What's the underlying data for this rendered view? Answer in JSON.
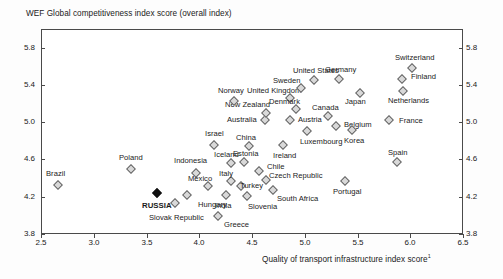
{
  "chart_data": {
    "type": "scatter",
    "title": "",
    "ylabel": "WEF Global competitiveness index score (overall index)",
    "xlabel": "Quality of transport infrastructure index score",
    "xlabel_footnote": "1",
    "xlim": [
      2.5,
      6.5
    ],
    "ylim": [
      3.8,
      6.0
    ],
    "xticks": [
      "2.5",
      "3.0",
      "3.5",
      "4.0",
      "4.5",
      "5.0",
      "5.5",
      "6.0",
      "6.5"
    ],
    "xtick_values": [
      2.5,
      3.0,
      3.5,
      4.0,
      4.5,
      5.0,
      5.5,
      6.0,
      6.5
    ],
    "yticks": [
      "5.8",
      "5.4",
      "5.0",
      "4.6",
      "4.2",
      "3.8"
    ],
    "ytick_values": [
      5.8,
      5.4,
      5.0,
      4.6,
      4.2,
      3.8
    ],
    "grid": false,
    "legend": "none",
    "marker_shape": "diamond",
    "marker_fill": "#d9d9d9",
    "marker_edge": "#666666",
    "highlight_fill": "#111111",
    "points": [
      {
        "name": "Brazil",
        "x": 2.66,
        "y": 4.33,
        "lx": -2,
        "ly": -11,
        "anchor": "middle",
        "bold": false
      },
      {
        "name": "Poland",
        "x": 3.35,
        "y": 4.5,
        "lx": 0,
        "ly": -11,
        "anchor": "middle",
        "bold": false
      },
      {
        "name": "RUSSIA",
        "x": 3.6,
        "y": 4.24,
        "lx": 0,
        "ly": 13,
        "anchor": "middle",
        "bold": true
      },
      {
        "name": "Slovak Republic",
        "x": 3.77,
        "y": 4.13,
        "lx": 2,
        "ly": 15,
        "anchor": "middle",
        "bold": false
      },
      {
        "name": "Hungary",
        "x": 3.88,
        "y": 4.22,
        "lx": 26,
        "ly": 10,
        "anchor": "middle",
        "bold": false
      },
      {
        "name": "Indonesia",
        "x": 3.97,
        "y": 4.45,
        "lx": -6,
        "ly": -12,
        "anchor": "middle",
        "bold": false
      },
      {
        "name": "Mexico",
        "x": 4.08,
        "y": 4.32,
        "lx": -8,
        "ly": -7,
        "anchor": "middle",
        "bold": false
      },
      {
        "name": "Greece",
        "x": 4.18,
        "y": 3.99,
        "lx": 18,
        "ly": 9,
        "anchor": "middle",
        "bold": false
      },
      {
        "name": "India",
        "x": 4.25,
        "y": 4.22,
        "lx": -2,
        "ly": 11,
        "anchor": "middle",
        "bold": false
      },
      {
        "name": "Italy",
        "x": 4.3,
        "y": 4.37,
        "lx": -5,
        "ly": -7,
        "anchor": "middle",
        "bold": false
      },
      {
        "name": "Iceland",
        "x": 4.3,
        "y": 4.56,
        "lx": -4,
        "ly": -8,
        "anchor": "middle",
        "bold": false
      },
      {
        "name": "Turkey",
        "x": 4.4,
        "y": 4.32,
        "lx": 10,
        "ly": 0,
        "anchor": "middle",
        "bold": false
      },
      {
        "name": "Estonia",
        "x": 4.42,
        "y": 4.57,
        "lx": 2,
        "ly": -8,
        "anchor": "middle",
        "bold": false
      },
      {
        "name": "Slovenia",
        "x": 4.45,
        "y": 4.21,
        "lx": 16,
        "ly": 11,
        "anchor": "middle",
        "bold": false
      },
      {
        "name": "China",
        "x": 4.47,
        "y": 4.74,
        "lx": -3,
        "ly": -8,
        "anchor": "middle",
        "bold": false
      },
      {
        "name": "Israel",
        "x": 4.14,
        "y": 4.76,
        "lx": 0,
        "ly": -11,
        "anchor": "middle",
        "bold": false
      },
      {
        "name": "Chile",
        "x": 4.57,
        "y": 4.48,
        "lx": 16,
        "ly": -4,
        "anchor": "middle",
        "bold": false
      },
      {
        "name": "South Africa",
        "x": 4.7,
        "y": 4.27,
        "lx": 24,
        "ly": 9,
        "anchor": "middle",
        "bold": false
      },
      {
        "name": "Czech Republic",
        "x": 4.63,
        "y": 4.38,
        "lx": 30,
        "ly": -4,
        "anchor": "middle",
        "bold": false
      },
      {
        "name": "Australia",
        "x": 4.62,
        "y": 5.02,
        "lx": -23,
        "ly": 0,
        "anchor": "middle",
        "bold": false
      },
      {
        "name": "New Zealand",
        "x": 4.63,
        "y": 5.1,
        "lx": -18,
        "ly": -8,
        "anchor": "middle",
        "bold": false
      },
      {
        "name": "Norway",
        "x": 4.33,
        "y": 5.23,
        "lx": -3,
        "ly": -10,
        "anchor": "middle",
        "bold": false
      },
      {
        "name": "Ireland",
        "x": 4.79,
        "y": 4.76,
        "lx": 2,
        "ly": 11,
        "anchor": "middle",
        "bold": false
      },
      {
        "name": "Austria",
        "x": 4.86,
        "y": 5.02,
        "lx": 20,
        "ly": 0,
        "anchor": "middle",
        "bold": false
      },
      {
        "name": "United Kingdom",
        "x": 4.86,
        "y": 5.26,
        "lx": -16,
        "ly": -7,
        "anchor": "middle",
        "bold": false
      },
      {
        "name": "Denmark",
        "x": 4.92,
        "y": 5.14,
        "lx": -12,
        "ly": -7,
        "anchor": "middle",
        "bold": false
      },
      {
        "name": "Sweden",
        "x": 4.96,
        "y": 5.37,
        "lx": -14,
        "ly": -7,
        "anchor": "middle",
        "bold": false
      },
      {
        "name": "United States",
        "x": 5.09,
        "y": 5.45,
        "lx": 2,
        "ly": -9,
        "anchor": "middle",
        "bold": false
      },
      {
        "name": "Luxembourg",
        "x": 5.02,
        "y": 4.91,
        "lx": 14,
        "ly": 11,
        "anchor": "middle",
        "bold": false
      },
      {
        "name": "Canada",
        "x": 5.22,
        "y": 5.07,
        "lx": -2,
        "ly": -8,
        "anchor": "middle",
        "bold": false
      },
      {
        "name": "Germany",
        "x": 5.32,
        "y": 5.46,
        "lx": 2,
        "ly": -9,
        "anchor": "middle",
        "bold": false
      },
      {
        "name": "Portugal",
        "x": 5.38,
        "y": 4.37,
        "lx": 2,
        "ly": 11,
        "anchor": "middle",
        "bold": false
      },
      {
        "name": "Belgium",
        "x": 5.3,
        "y": 4.96,
        "lx": 22,
        "ly": -1,
        "anchor": "middle",
        "bold": false
      },
      {
        "name": "Korea",
        "x": 5.45,
        "y": 4.92,
        "lx": 2,
        "ly": 11,
        "anchor": "middle",
        "bold": false
      },
      {
        "name": "Japan",
        "x": 5.52,
        "y": 5.31,
        "lx": -4,
        "ly": 9,
        "anchor": "middle",
        "bold": false
      },
      {
        "name": "Spain",
        "x": 5.87,
        "y": 4.57,
        "lx": 1,
        "ly": -9,
        "anchor": "middle",
        "bold": false
      },
      {
        "name": "Netherlands",
        "x": 5.93,
        "y": 5.33,
        "lx": 6,
        "ly": 10,
        "anchor": "middle",
        "bold": false
      },
      {
        "name": "Finland",
        "x": 5.92,
        "y": 5.46,
        "lx": 22,
        "ly": -2,
        "anchor": "middle",
        "bold": false
      },
      {
        "name": "Switzerland",
        "x": 6.02,
        "y": 5.58,
        "lx": 2,
        "ly": -10,
        "anchor": "middle",
        "bold": false
      },
      {
        "name": "France",
        "x": 5.8,
        "y": 5.02,
        "lx": 22,
        "ly": 1,
        "anchor": "middle",
        "bold": false
      }
    ]
  }
}
